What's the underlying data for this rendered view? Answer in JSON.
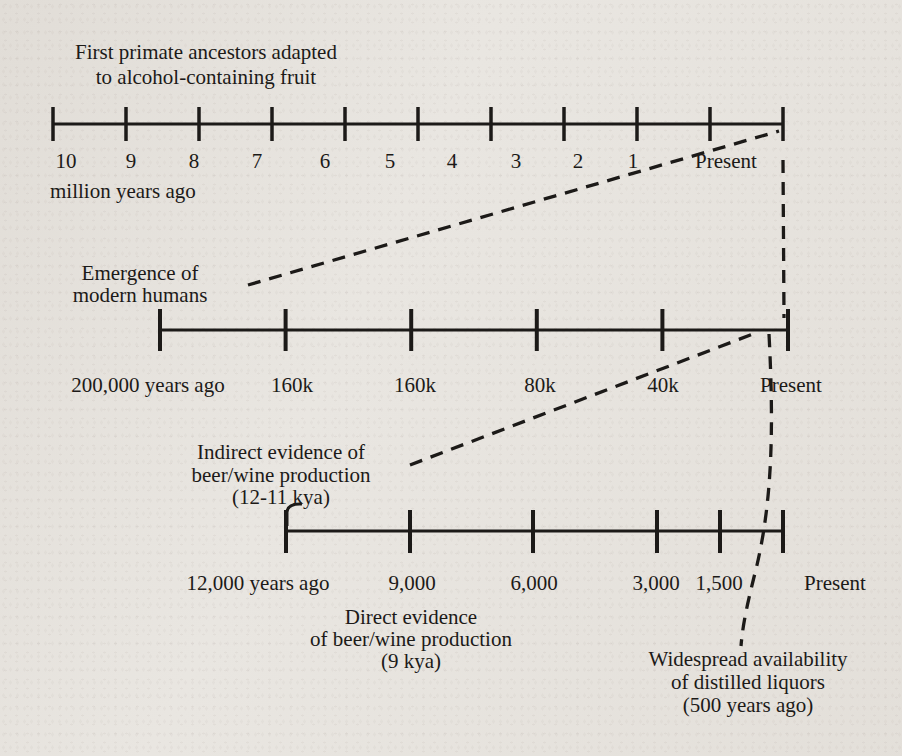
{
  "figure": {
    "paper_color": "#e9e6e1",
    "ink_color": "#1c1a18"
  },
  "annotations": {
    "primate": {
      "lines": [
        "First primate ancestors adapted",
        "to alcohol-containing fruit"
      ]
    },
    "humans": {
      "lines": [
        "Emergence of",
        "modern humans"
      ]
    },
    "indirect": {
      "lines": [
        "Indirect evidence of",
        "beer/wine production",
        "(12-11 kya)"
      ]
    },
    "direct": {
      "lines": [
        "Direct evidence",
        "of beer/wine production",
        "(9 kya)"
      ]
    },
    "distilled": {
      "lines": [
        "Widespread availability",
        "of distilled liquors",
        "(500 years ago)"
      ]
    }
  },
  "timelines": [
    {
      "id": "primate-timeline",
      "caption": "million years ago",
      "ticks": [
        "10",
        "9",
        "8",
        "7",
        "6",
        "5",
        "4",
        "3",
        "2",
        "1",
        "Present"
      ]
    },
    {
      "id": "modern-humans-timeline",
      "caption": "",
      "ticks": [
        "200,000 years ago",
        "160k",
        "160k",
        "80k",
        "40k",
        "Present"
      ]
    },
    {
      "id": "beer-wine-timeline",
      "caption": "",
      "ticks": [
        "12,000 years ago",
        "9,000",
        "6,000",
        "3,000",
        "1,500",
        "Present"
      ]
    }
  ]
}
